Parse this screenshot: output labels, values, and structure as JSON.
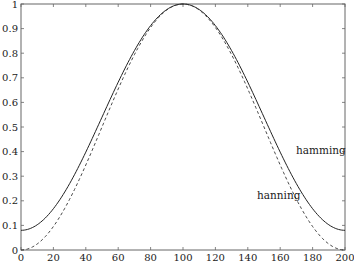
{
  "chart_data": {
    "type": "line",
    "title": "",
    "xlabel": "",
    "ylabel": "",
    "xlim": [
      0,
      200
    ],
    "ylim": [
      0,
      1
    ],
    "grid": false,
    "legend": "inline text annotations",
    "x_ticks": [
      0,
      20,
      40,
      60,
      80,
      100,
      120,
      140,
      160,
      180,
      200
    ],
    "x_tick_labels": [
      "0",
      "20",
      "40",
      "60",
      "80",
      "100",
      "120",
      "140",
      "160",
      "180",
      "200"
    ],
    "y_ticks": [
      0,
      0.1,
      0.2,
      0.3,
      0.4,
      0.5,
      0.6,
      0.7,
      0.8,
      0.9,
      1
    ],
    "y_tick_labels": [
      "0",
      "0.1",
      "0.2",
      "0.3",
      "0.4",
      "0.5",
      "0.6",
      "0.7",
      "0.8",
      "0.9",
      "1"
    ],
    "x": [
      0,
      10,
      20,
      30,
      40,
      50,
      60,
      70,
      80,
      90,
      100,
      110,
      120,
      130,
      140,
      150,
      160,
      170,
      180,
      190,
      200
    ],
    "series": [
      {
        "name": "hamming",
        "style": "solid",
        "values": [
          0.08,
          0.103,
          0.168,
          0.27,
          0.398,
          0.54,
          0.682,
          0.81,
          0.912,
          0.977,
          1.0,
          0.977,
          0.912,
          0.81,
          0.682,
          0.54,
          0.398,
          0.27,
          0.168,
          0.103,
          0.08
        ]
      },
      {
        "name": "hanning",
        "style": "dashed",
        "values": [
          0.0,
          0.024,
          0.095,
          0.206,
          0.345,
          0.5,
          0.655,
          0.794,
          0.905,
          0.976,
          1.0,
          0.976,
          0.905,
          0.794,
          0.655,
          0.5,
          0.345,
          0.206,
          0.095,
          0.024,
          0.0
        ]
      }
    ],
    "annotations": [
      {
        "text": "hamming",
        "x": 175,
        "y": 0.42
      },
      {
        "text": "hanning",
        "x": 145,
        "y": 0.235
      }
    ]
  },
  "colors": {
    "axes": "#555555",
    "line": "#222222",
    "text": "#1a1a1a"
  }
}
